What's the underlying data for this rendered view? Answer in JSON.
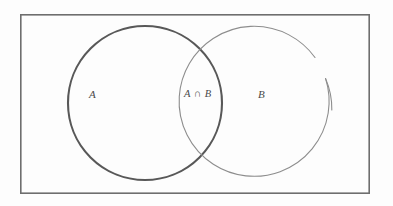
{
  "figure": {
    "kind": "venn-diagram",
    "background_color": "#fdfdfd",
    "width": 393,
    "height": 206
  },
  "universe_rectangle": {
    "name": "universal-set-box",
    "x": 20,
    "y": 14,
    "width": 350,
    "height": 180,
    "stroke_color": "#6e6e6e",
    "stroke_width": 1.6,
    "fill": "none"
  },
  "circles": [
    {
      "id": "set-a",
      "label": "A",
      "cx": 145,
      "cy": 103,
      "r": 77,
      "stroke_color": "#585858",
      "stroke_width": 2.1,
      "fill": "none",
      "complete": true
    },
    {
      "id": "set-b",
      "label": "B",
      "cx": 257,
      "cy": 104,
      "r": 75,
      "stroke_color": "#8d8d8d",
      "stroke_width": 1.1,
      "fill": "none",
      "complete": false,
      "gap_note": "stroke broken on upper-right arc"
    }
  ],
  "labels": {
    "set_a": "A",
    "set_b": "B",
    "intersection": "A ∩ B"
  },
  "label_positions": {
    "set_a": {
      "x": 97,
      "y": 96
    },
    "set_b": {
      "x": 266,
      "y": 96
    },
    "intersection": {
      "x": 200,
      "y": 96
    }
  },
  "symbols": {
    "intersection_operator": "∩"
  },
  "colors": {
    "background": "#fdfdfd",
    "box_stroke": "#6e6e6e",
    "circle_a_stroke": "#585858",
    "circle_b_stroke": "#8d8d8d",
    "text": "#4a4a4a"
  }
}
